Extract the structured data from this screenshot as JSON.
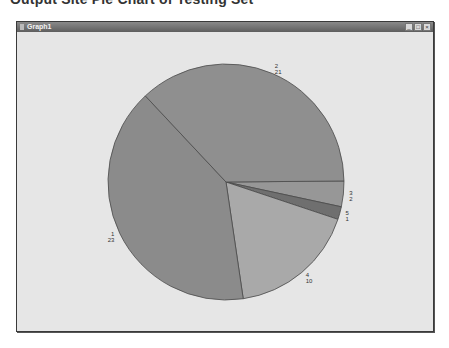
{
  "caption": "Output Site Pie Chart of Testing Set",
  "window": {
    "title": "Graph1",
    "buttons": {
      "minimize": "_",
      "maximize": "□",
      "close": "×"
    }
  },
  "chart_data": {
    "type": "pie",
    "title": "",
    "categories": [
      "1",
      "2",
      "3",
      "4",
      "5"
    ],
    "values": [
      23,
      21,
      2,
      10,
      1
    ],
    "labels": [
      {
        "category": "1",
        "value": "23"
      },
      {
        "category": "2",
        "value": "21"
      },
      {
        "category": "3",
        "value": "2"
      },
      {
        "category": "4",
        "value": "10"
      },
      {
        "category": "5",
        "value": "1"
      }
    ],
    "colors": {
      "1": "#8b8b8b",
      "2": "#8f8f8f",
      "3": "#979797",
      "4": "#a9a9a9",
      "5": "#6f6f6f"
    },
    "slice_order_clockwise_from_right": [
      "3",
      "5",
      "4",
      "1",
      "2"
    ],
    "legend": "none"
  }
}
